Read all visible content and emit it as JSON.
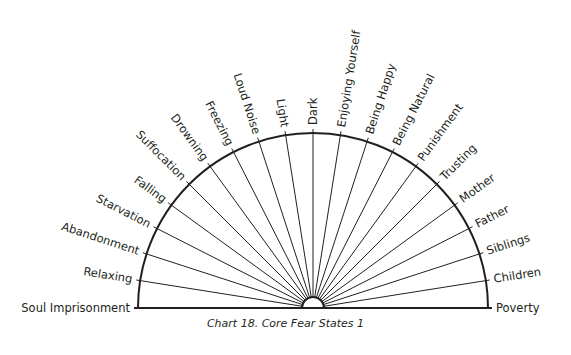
{
  "chart_data": {
    "type": "radial-semicircle-chart",
    "title": "Chart 18. Core Fear States 1",
    "orientation": "labels read left-to-right across a 180° arc, from 180° (left baseline) to 0° (right baseline)",
    "labels": [
      "Soul Imprisonment",
      "Relaxing",
      "Abandonment",
      "Starvation",
      "Falling",
      "Suffocation",
      "Drowning",
      "Freezing",
      "Loud Noise",
      "Light",
      "Dark",
      "Enjoying Yourself",
      "Being Happy",
      "Being Natural",
      "Punishment",
      "Trusting",
      "Mother",
      "Father",
      "Siblings",
      "Children",
      "Poverty"
    ],
    "segment_count": 21,
    "line_color": "#231f20"
  },
  "caption": {
    "text": "Chart 18. Core Fear States 1"
  },
  "geometry": {
    "cx": 313,
    "cy": 308,
    "outer_radius": 175,
    "inner_radius": 11,
    "label_offset": 6
  }
}
